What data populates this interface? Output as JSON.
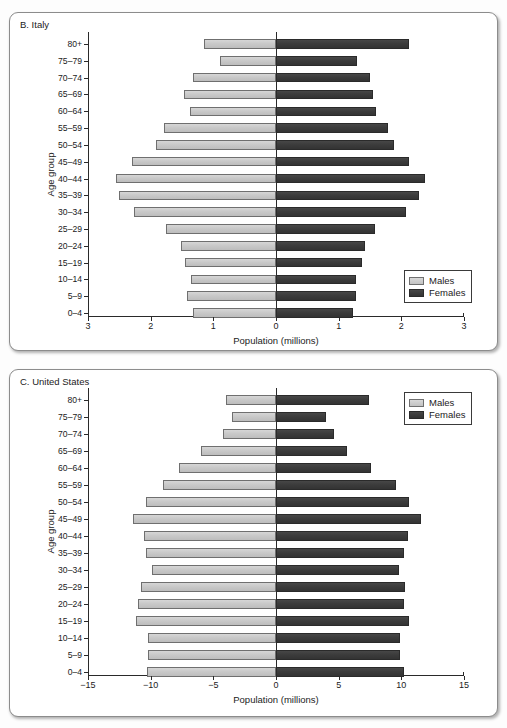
{
  "top_clipped_text": "",
  "colors": {
    "male": "#c9c9c9",
    "female": "#3c3c3c",
    "axis": "#2a2a2a",
    "panel_border": "#8c8c8c",
    "background": "#ffffff"
  },
  "legend": {
    "males_label": "Males",
    "females_label": "Females"
  },
  "panels": [
    {
      "id": "italy",
      "label": "B. Italy"
    },
    {
      "id": "us",
      "label": "C. United States"
    }
  ],
  "chart_data": [
    {
      "type": "bar",
      "subtype": "population-pyramid",
      "title": "B. Italy",
      "xlabel": "Population (millions)",
      "ylabel": "Age group",
      "grid": false,
      "legend_position": "bottom-right",
      "xlim": [
        -3,
        3
      ],
      "xticks": [
        -3,
        -2,
        -1,
        0,
        1,
        2,
        3
      ],
      "xticklabels": [
        "3",
        "2",
        "1",
        "0",
        "1",
        "2",
        "3"
      ],
      "categories": [
        "80+",
        "75–79",
        "70–74",
        "65–69",
        "60–64",
        "55–59",
        "50–54",
        "45–49",
        "40–44",
        "35–39",
        "30–34",
        "25–29",
        "20–24",
        "15–19",
        "10–14",
        "5–9",
        "0–4"
      ],
      "series": [
        {
          "name": "Males",
          "color": "#c9c9c9",
          "values": [
            1.15,
            0.9,
            1.32,
            1.47,
            1.38,
            1.78,
            1.92,
            2.3,
            2.55,
            2.5,
            2.27,
            1.75,
            1.52,
            1.45,
            1.35,
            1.42,
            1.33
          ]
        },
        {
          "name": "Females",
          "color": "#3c3c3c",
          "values": [
            2.13,
            1.3,
            1.5,
            1.55,
            1.6,
            1.78,
            1.88,
            2.12,
            2.38,
            2.28,
            2.08,
            1.58,
            1.42,
            1.38,
            1.27,
            1.28,
            1.23
          ]
        }
      ]
    },
    {
      "type": "bar",
      "subtype": "population-pyramid",
      "title": "C. United States",
      "xlabel": "Population (millions)",
      "ylabel": "Age group",
      "grid": false,
      "legend_position": "top-right",
      "xlim": [
        -15,
        15
      ],
      "xticks": [
        -15,
        -10,
        -5,
        0,
        5,
        10,
        15
      ],
      "xticklabels": [
        "−15",
        "−10",
        "−5",
        "0",
        "5",
        "10",
        "15"
      ],
      "categories": [
        "80+",
        "75–79",
        "70–74",
        "65–69",
        "60–64",
        "55–59",
        "50–54",
        "45–49",
        "40–44",
        "35–39",
        "30–34",
        "25–29",
        "20–24",
        "15–19",
        "10–14",
        "5–9",
        "0–4"
      ],
      "series": [
        {
          "name": "Males",
          "color": "#c9c9c9",
          "values": [
            4.0,
            3.5,
            4.2,
            6.0,
            7.7,
            9.0,
            10.4,
            11.4,
            10.5,
            10.4,
            9.9,
            10.8,
            11.0,
            11.2,
            10.2,
            10.2,
            10.3
          ]
        },
        {
          "name": "Females",
          "color": "#3c3c3c",
          "values": [
            7.4,
            4.0,
            4.6,
            5.7,
            7.6,
            9.6,
            10.6,
            11.6,
            10.5,
            10.2,
            9.8,
            10.3,
            10.2,
            10.6,
            9.9,
            9.9,
            10.2
          ]
        }
      ]
    }
  ]
}
